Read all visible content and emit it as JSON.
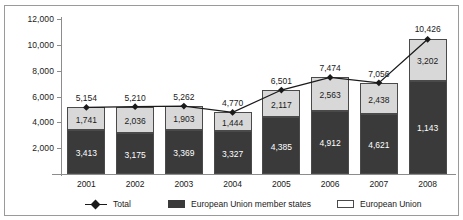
{
  "chart_data": {
    "type": "bar",
    "subtype": "stacked-bar-with-line-overlay",
    "title": "",
    "subtitle": "",
    "xlabel": "",
    "ylabel": "€ million",
    "categories": [
      "2001",
      "2002",
      "2003",
      "2004",
      "2005",
      "2006",
      "2007",
      "2008"
    ],
    "ylim": [
      0,
      12000
    ],
    "yticks": [
      2000,
      4000,
      6000,
      8000,
      10000,
      12000
    ],
    "ytick_labels": [
      "2,000",
      "4,000",
      "6,000",
      "8,000",
      "10,000",
      "12,000"
    ],
    "grid": false,
    "legend_position": "bottom",
    "series": [
      {
        "name": "European Union member states",
        "type": "bar",
        "stack": "total",
        "color": "#3a3a3a",
        "values": [
          3413,
          3175,
          3369,
          3327,
          4385,
          4912,
          4621,
          7224
        ],
        "labels": [
          "3,413",
          "3,175",
          "3,369",
          "3,327",
          "4,385",
          "4,912",
          "4,621",
          "1,143"
        ]
      },
      {
        "name": "European Union",
        "type": "bar",
        "stack": "total",
        "color": "#d8d8d8",
        "values": [
          1741,
          2036,
          1903,
          1444,
          2117,
          2563,
          2438,
          3202
        ],
        "labels": [
          "1,741",
          "2,036",
          "1,903",
          "1,444",
          "2,117",
          "2,563",
          "2,438",
          "3,202"
        ]
      },
      {
        "name": "Total",
        "type": "line",
        "color": "#1a1a1a",
        "marker": "diamond",
        "values": [
          5154,
          5210,
          5262,
          4770,
          6501,
          7474,
          7056,
          10426
        ],
        "labels": [
          "5,154",
          "5,210",
          "5,262",
          "4,770",
          "6,501",
          "7,474",
          "7,056",
          "10,426"
        ]
      }
    ]
  },
  "legend": {
    "items": [
      {
        "label": "Total",
        "marker": "line-diamond"
      },
      {
        "label": "European Union member states",
        "marker": "swatch-dark"
      },
      {
        "label": "European Union",
        "marker": "swatch-light"
      }
    ]
  }
}
